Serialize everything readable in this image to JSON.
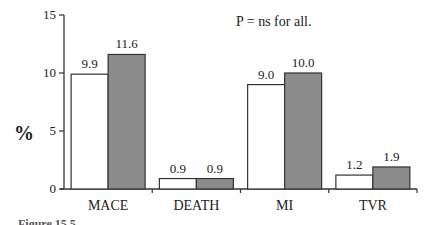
{
  "chart_data": {
    "type": "bar",
    "title": "",
    "annotation": "P = ns for all.",
    "xlabel": "",
    "ylabel": "%",
    "ylim": [
      0,
      15
    ],
    "yticks": [
      "0",
      "5",
      "10",
      "15"
    ],
    "ytick_values": [
      0,
      5,
      10,
      15
    ],
    "categories": [
      "MACE",
      "DEATH",
      "MI",
      "TVR"
    ],
    "series": [
      {
        "name": "Group 1",
        "fill": "#ffffff",
        "values": [
          9.9,
          0.9,
          9.0,
          1.2
        ],
        "labels": [
          "9.9",
          "0.9",
          "9.0",
          "1.2"
        ]
      },
      {
        "name": "Group 2",
        "fill": "#8c8c8c",
        "values": [
          11.6,
          0.9,
          10.0,
          1.9
        ],
        "labels": [
          "11.6",
          "0.9",
          "10.0",
          "1.9"
        ]
      }
    ],
    "grid": false,
    "legend": "none"
  },
  "caption": "Figure 15.5"
}
